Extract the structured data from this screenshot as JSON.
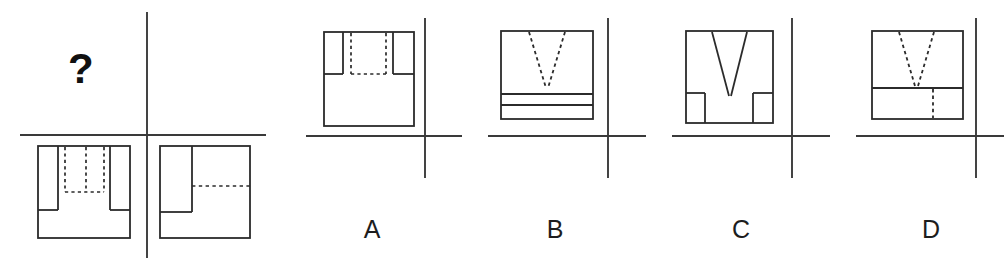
{
  "figure": {
    "type": "orthographic-projection-puzzle",
    "prompt_symbol": "?",
    "given_views": {
      "missing_view_marker": "?",
      "front_view_label": "",
      "top_view_label": ""
    },
    "options": [
      {
        "id": "A",
        "label": "A"
      },
      {
        "id": "B",
        "label": "B"
      },
      {
        "id": "C",
        "label": "C"
      },
      {
        "id": "D",
        "label": "D"
      }
    ]
  },
  "colors": {
    "line": "#2b2b2b",
    "axis": "#3a3a3a",
    "background": "#ffffff",
    "text": "#1d1d1d"
  },
  "geometry": {
    "question_mark": {
      "x": 68,
      "y": 52
    },
    "given_axis": {
      "vertical_x": 147,
      "horizontal_y": 135,
      "h_x1": 20,
      "h_x2": 266,
      "v_y1": 12,
      "v_y2": 258
    },
    "given_view_left": {
      "x": 38,
      "y": 146,
      "w": 92,
      "h": 92
    },
    "given_view_right": {
      "x": 160,
      "y": 146,
      "w": 90,
      "h": 92
    },
    "option_axes": [
      {
        "id": "A",
        "vertical_x": 425,
        "horizontal_y": 136,
        "h_x1": 306,
        "h_x2": 462,
        "v_y1": 18,
        "v_y2": 178
      },
      {
        "id": "B",
        "vertical_x": 608,
        "horizontal_y": 136,
        "h_x1": 488,
        "h_x2": 646,
        "v_y1": 18,
        "v_y2": 178
      },
      {
        "id": "C",
        "vertical_x": 792,
        "horizontal_y": 136,
        "h_x1": 672,
        "h_x2": 830,
        "v_y1": 18,
        "v_y2": 178
      },
      {
        "id": "D",
        "vertical_x": 976,
        "horizontal_y": 136,
        "h_x1": 856,
        "h_x2": 1004,
        "v_y1": 18,
        "v_y2": 178
      }
    ],
    "option_views": [
      {
        "id": "A",
        "x": 324,
        "y": 32,
        "w": 90,
        "h": 94
      },
      {
        "id": "B",
        "x": 501,
        "y": 31,
        "w": 92,
        "h": 88
      },
      {
        "id": "C",
        "x": 686,
        "y": 31,
        "w": 87,
        "h": 92
      },
      {
        "id": "D",
        "x": 872,
        "y": 31,
        "w": 91,
        "h": 88
      }
    ],
    "label_positions": [
      {
        "id": "A",
        "x": 352,
        "y": 215
      },
      {
        "id": "B",
        "x": 535,
        "y": 215
      },
      {
        "id": "C",
        "x": 721,
        "y": 215
      },
      {
        "id": "D",
        "x": 911,
        "y": 215
      }
    ]
  }
}
